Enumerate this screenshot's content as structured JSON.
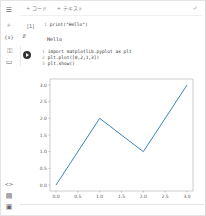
{
  "toolbar": {
    "add_code_label": "+ コード",
    "add_text_label": "+ テキスト",
    "collapse_icon": "chevron-check-icon"
  },
  "rail": {
    "icons": [
      {
        "name": "menu-icon",
        "glyph": "☰"
      },
      {
        "name": "search-icon",
        "glyph": "⌕"
      },
      {
        "name": "variables-icon",
        "glyph": "{x}"
      },
      {
        "name": "key-icon",
        "glyph": "⚿"
      },
      {
        "name": "folder-icon",
        "glyph": "▭"
      },
      {
        "name": "code-icon",
        "glyph": "<>"
      },
      {
        "name": "terminal-icon",
        "glyph": "▤"
      },
      {
        "name": "command-palette-icon",
        "glyph": "▣"
      }
    ]
  },
  "cells": [
    {
      "exec_count": "[1]",
      "lines": [
        {
          "n": "1",
          "code": "print(\"Hello\")"
        }
      ],
      "output": "Hello"
    },
    {
      "exec_count": "",
      "lines": [
        {
          "n": "1",
          "code": "import matplotlib.pyplot as plt"
        },
        {
          "n": "2",
          "code": "plt.plot([0,2,1,3])"
        },
        {
          "n": "3",
          "code": "plt.show()"
        }
      ]
    }
  ],
  "chart_data": {
    "type": "line",
    "title": "",
    "xlabel": "",
    "ylabel": "",
    "x": [
      0,
      1,
      2,
      3
    ],
    "series": [
      {
        "name": "line",
        "values": [
          0,
          2,
          1,
          3
        ],
        "color": "#1f77b4"
      }
    ],
    "xlim": [
      0,
      3
    ],
    "ylim": [
      0,
      3
    ],
    "xticks": [
      "0.0",
      "0.5",
      "1.0",
      "1.5",
      "2.0",
      "2.5",
      "3.0"
    ],
    "yticks": [
      "0.0",
      "0.5",
      "1.0",
      "1.5",
      "2.0",
      "2.5",
      "3.0"
    ],
    "grid": false,
    "legend": false
  }
}
